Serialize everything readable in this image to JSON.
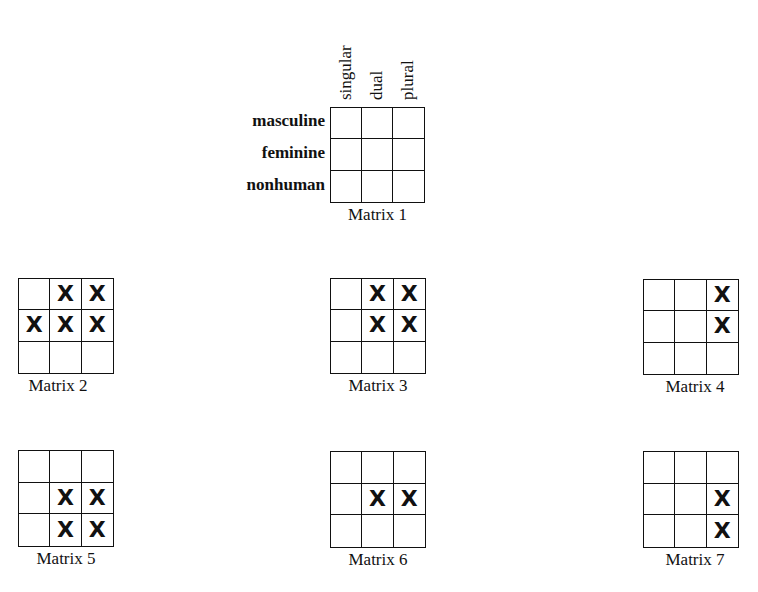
{
  "row_labels": [
    "masculine",
    "feminine",
    "nonhuman"
  ],
  "column_labels": [
    "singular",
    "dual",
    "plural"
  ],
  "mark": "X",
  "matrices": [
    {
      "name": "Matrix 1",
      "marks": [
        [
          0,
          0,
          0
        ],
        [
          0,
          0,
          0
        ],
        [
          0,
          0,
          0
        ]
      ]
    },
    {
      "name": "Matrix 2",
      "marks": [
        [
          0,
          1,
          1
        ],
        [
          1,
          1,
          1
        ],
        [
          0,
          0,
          0
        ]
      ]
    },
    {
      "name": "Matrix 3",
      "marks": [
        [
          0,
          1,
          1
        ],
        [
          0,
          1,
          1
        ],
        [
          0,
          0,
          0
        ]
      ]
    },
    {
      "name": "Matrix 4",
      "marks": [
        [
          0,
          0,
          1
        ],
        [
          0,
          0,
          1
        ],
        [
          0,
          0,
          0
        ]
      ]
    },
    {
      "name": "Matrix 5",
      "marks": [
        [
          0,
          0,
          0
        ],
        [
          0,
          1,
          1
        ],
        [
          0,
          1,
          1
        ]
      ]
    },
    {
      "name": "Matrix 6",
      "marks": [
        [
          0,
          0,
          0
        ],
        [
          0,
          1,
          1
        ],
        [
          0,
          0,
          0
        ]
      ]
    },
    {
      "name": "Matrix 7",
      "marks": [
        [
          0,
          0,
          0
        ],
        [
          0,
          0,
          1
        ],
        [
          0,
          0,
          1
        ]
      ]
    }
  ]
}
